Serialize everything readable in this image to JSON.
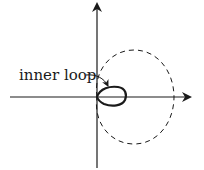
{
  "diagram": {
    "type": "polar-curve-limacon",
    "annotation": {
      "text": "inner loop"
    },
    "colors": {
      "stroke": "#1a1a1a",
      "background": "#ffffff"
    },
    "elements": [
      "x-axis",
      "y-axis",
      "dashed-outer-loop",
      "solid-inner-loop",
      "pointer-arrow"
    ]
  }
}
